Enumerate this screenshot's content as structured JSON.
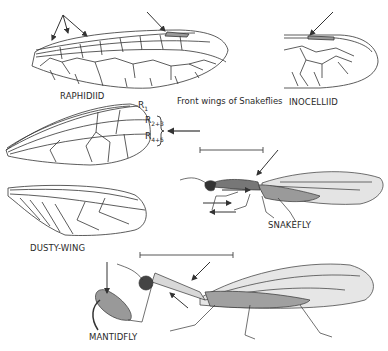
{
  "figure": {
    "caption": "Front wings of Snakeflies",
    "labels": {
      "raphidiid": "RAPHIDIID",
      "inocelliid": "INOCELLIID",
      "dusty_wing": "DUSTY-WING",
      "snakefly": "SNAKEFLY",
      "mantidfly": "MANTIDFLY"
    },
    "vein_labels": {
      "r1": {
        "base": "R",
        "sub": "1"
      },
      "r23": {
        "base": "R",
        "sub": "2+3"
      },
      "r45": {
        "base": "R",
        "sub": "4+5"
      }
    },
    "colors": {
      "ink": "#2a2a2a",
      "shading": "#8a8a8a",
      "background": "#ffffff"
    }
  }
}
